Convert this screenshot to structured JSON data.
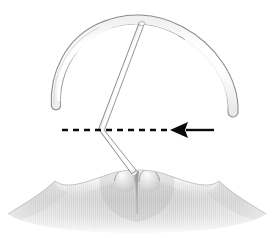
{
  "figure": {
    "title": "Intrauterine device positioned at the uterine fundus",
    "caption": "",
    "width": 274,
    "height": 238,
    "background_color": "#ffffff"
  },
  "colors": {
    "outline": "#8c8c8c",
    "outline_dark": "#6e6e6e",
    "device_fill_light": "#ffffff",
    "device_fill_shade": "#f2f2f2",
    "device_highlight": "#fcfcfc",
    "tissue_light": "#f4f4f4",
    "tissue_mid": "#d2d2d2",
    "tissue_dark": "#b4b4b4",
    "tissue_shadow": "#9a9a9a",
    "annotation_black": "#0a0a0a"
  },
  "elements": {
    "device": {
      "label": "IUD arched frame",
      "arch": {
        "label": "Transverse arched arm",
        "apex": {
          "x": 139,
          "y": 21
        },
        "left_tip": {
          "x": 56,
          "y": 106
        },
        "right_tip": {
          "x": 233,
          "y": 112
        },
        "stroke_width": 1.1,
        "tube_width": 9
      },
      "stem": {
        "label": "Vertical stem / insertion tube",
        "top": {
          "x": 142,
          "y": 23
        },
        "bend": {
          "x": 101,
          "y": 130
        },
        "bottom": {
          "x": 134,
          "y": 172
        },
        "tube_width": 5
      }
    },
    "tissue": {
      "label": "Uterine fundus tissue",
      "left_peak": {
        "x": 55,
        "y": 181
      },
      "right_peak": {
        "x": 219,
        "y": 181
      },
      "center_notch": {
        "x": 137,
        "y": 170
      },
      "left_lobe": {
        "x": 122,
        "y": 173
      },
      "right_lobe": {
        "x": 151,
        "y": 172
      },
      "bottom": {
        "x": 137,
        "y": 232
      }
    },
    "reference_line": {
      "label": "Dashed reference plane",
      "start_x": 62,
      "end_x": 168,
      "y": 130,
      "dash_pattern": "6 5",
      "stroke_width": 2.4,
      "color": "#0a0a0a"
    },
    "arrow": {
      "label": "Direction indicator arrow",
      "direction": "left",
      "tip_x": 170,
      "tail_x": 214,
      "y": 130,
      "head_length": 16,
      "head_half_height": 8,
      "shaft_width": 2.4,
      "color": "#0a0a0a"
    }
  },
  "annotations": {
    "arrow_meaning": "",
    "line_meaning": ""
  }
}
